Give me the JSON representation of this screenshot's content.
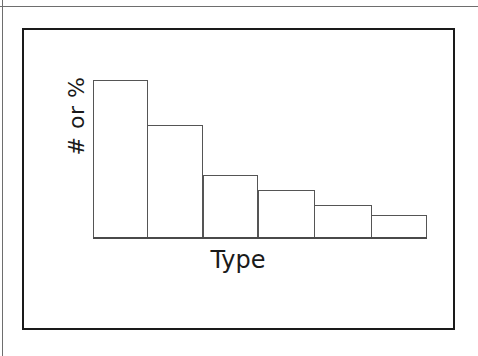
{
  "figure": {
    "frame_color": "#1a1a1a",
    "background": "#ffffff"
  },
  "labels": {
    "y_axis": "# or %",
    "x_axis": "Type"
  },
  "chart_data": {
    "type": "bar",
    "title": "",
    "subtitle": "",
    "xlabel": "Type",
    "ylabel": "# or %",
    "categories": [
      "1",
      "2",
      "3",
      "4",
      "5",
      "6"
    ],
    "values": [
      100,
      72,
      40,
      31,
      21,
      15
    ],
    "ylim": [
      0,
      105
    ],
    "grid": false,
    "legend": null,
    "tick_labels_x": [],
    "tick_labels_y": [],
    "annotations": [],
    "bar_style": {
      "fill": "#ffffff",
      "stroke": "#555555"
    },
    "pixel_geometry": {
      "baseline_y": 238,
      "bars": [
        {
          "x": 93,
          "width": 55,
          "top": 80
        },
        {
          "x": 147,
          "width": 56,
          "top": 125
        },
        {
          "x": 203,
          "width": 55,
          "top": 175
        },
        {
          "x": 258,
          "width": 57,
          "top": 190
        },
        {
          "x": 314,
          "width": 58,
          "top": 205
        },
        {
          "x": 371,
          "width": 56,
          "top": 215
        }
      ]
    }
  }
}
